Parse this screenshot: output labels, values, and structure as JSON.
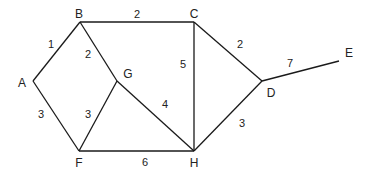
{
  "diagram": {
    "type": "weighted-undirected-graph",
    "nodes": [
      {
        "id": "A",
        "label": "A",
        "x": 33,
        "y": 81,
        "lx": 22,
        "ly": 87
      },
      {
        "id": "B",
        "label": "B",
        "x": 80,
        "y": 22,
        "lx": 79,
        "ly": 18
      },
      {
        "id": "C",
        "label": "C",
        "x": 194,
        "y": 22,
        "lx": 194,
        "ly": 18
      },
      {
        "id": "D",
        "label": "D",
        "x": 262,
        "y": 81,
        "lx": 271,
        "ly": 97
      },
      {
        "id": "E",
        "label": "E",
        "x": 339,
        "y": 61,
        "lx": 349,
        "ly": 57
      },
      {
        "id": "F",
        "label": "F",
        "x": 79,
        "y": 151,
        "lx": 79,
        "ly": 167
      },
      {
        "id": "G",
        "label": "G",
        "x": 117,
        "y": 81,
        "lx": 128,
        "ly": 78
      },
      {
        "id": "H",
        "label": "H",
        "x": 194,
        "y": 151,
        "lx": 194,
        "ly": 167
      }
    ],
    "edges": [
      {
        "from": "A",
        "to": "B",
        "weight": "1",
        "wx": 51,
        "wy": 48
      },
      {
        "from": "B",
        "to": "C",
        "weight": "2",
        "wx": 137,
        "wy": 18
      },
      {
        "from": "B",
        "to": "G",
        "weight": "2",
        "wx": 88,
        "wy": 58
      },
      {
        "from": "C",
        "to": "H",
        "weight": "5",
        "wx": 183,
        "wy": 68
      },
      {
        "from": "C",
        "to": "D",
        "weight": "2",
        "wx": 240,
        "wy": 48
      },
      {
        "from": "D",
        "to": "E",
        "weight": "7",
        "wx": 290,
        "wy": 67
      },
      {
        "from": "A",
        "to": "F",
        "weight": "3",
        "wx": 41,
        "wy": 118
      },
      {
        "from": "G",
        "to": "F",
        "weight": "3",
        "wx": 88,
        "wy": 118
      },
      {
        "from": "G",
        "to": "H",
        "weight": "4",
        "wx": 165,
        "wy": 108
      },
      {
        "from": "F",
        "to": "H",
        "weight": "6",
        "wx": 145,
        "wy": 166
      },
      {
        "from": "H",
        "to": "D",
        "weight": "3",
        "wx": 242,
        "wy": 127
      }
    ]
  }
}
